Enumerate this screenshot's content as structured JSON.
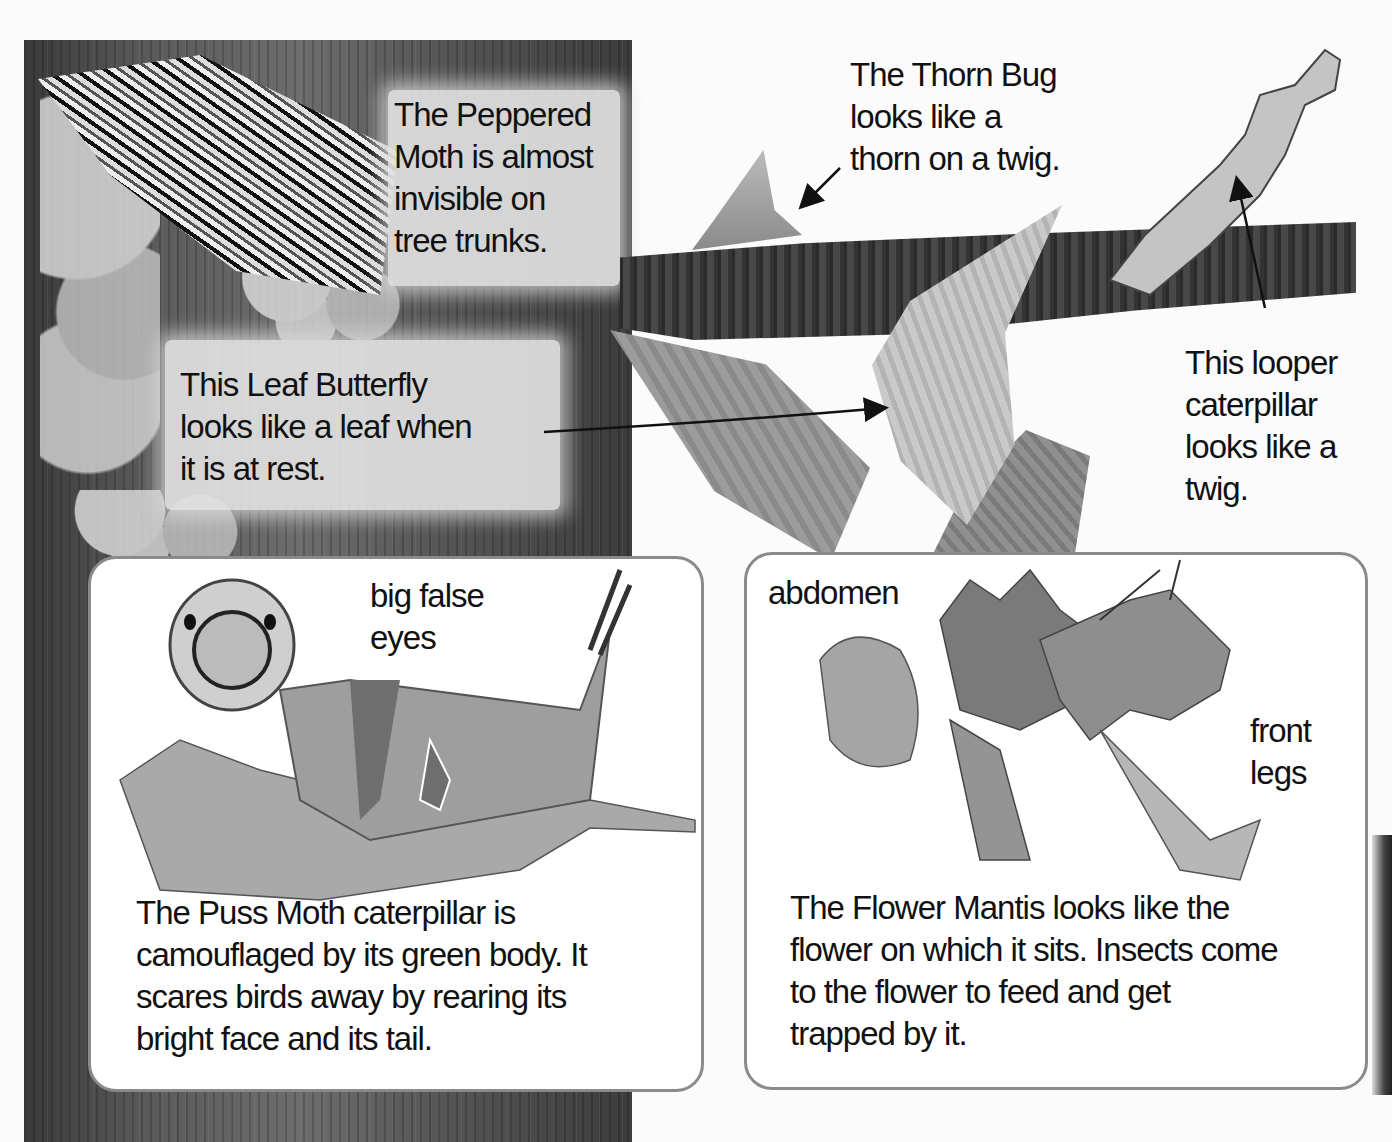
{
  "page": {
    "topic": "Insect camouflage",
    "colors": {
      "background": "#fbfbfb",
      "trunk": "#555555",
      "box_border": "#8a8a8a",
      "text": "#111111"
    }
  },
  "trunk_captions": {
    "peppered_moth": [
      "The Peppered",
      "Moth is almost",
      "invisible on",
      "tree trunks."
    ],
    "leaf_butterfly": [
      "This Leaf Butterfly",
      "looks like a leaf when",
      "it is at rest."
    ]
  },
  "branch_captions": {
    "thorn_bug": [
      "The Thorn Bug",
      "looks like a",
      "thorn on a twig."
    ],
    "looper": [
      "This looper",
      "caterpillar",
      "looks like a",
      "twig."
    ]
  },
  "puss_moth_box": {
    "label": [
      "big false",
      "eyes"
    ],
    "caption": [
      "The Puss Moth caterpillar is",
      "camouflaged by its green body. It",
      "scares birds away by rearing its",
      "bright face and its tail."
    ]
  },
  "flower_mantis_box": {
    "label_abdomen": "abdomen",
    "label_front_legs": [
      "front",
      "legs"
    ],
    "caption": [
      "The Flower Mantis looks like the",
      "flower on which it sits. Insects come",
      "to the flower to feed and get",
      "trapped by it."
    ]
  },
  "illustrations": {
    "peppered_moth": "peppered-moth-illustration",
    "leaf_butterfly": "leaf-butterfly-illustration",
    "thorn_bug": "thorn-bug-illustration",
    "looper_caterpillar": "looper-caterpillar-illustration",
    "puss_moth_caterpillar": "puss-moth-caterpillar-illustration",
    "flower_mantis": "flower-mantis-illustration"
  }
}
